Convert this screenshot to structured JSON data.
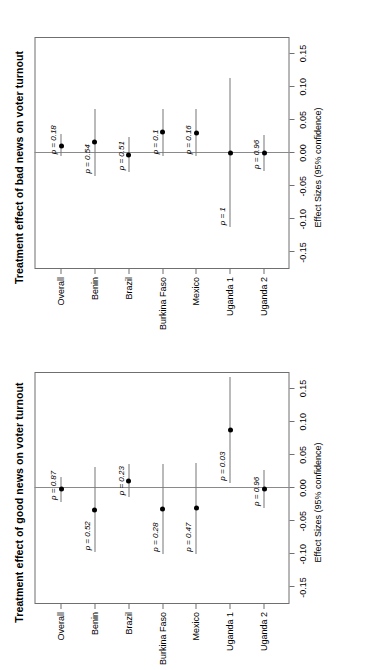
{
  "figure": {
    "orientation": "rotated-90-ccw",
    "axis_title": "Effect Sizes (95% confidence)",
    "xticks": [
      "-0.15",
      "-0.10",
      "-0.05",
      "0.00",
      "0.05",
      "0.10",
      "0.15"
    ],
    "categories": [
      "Overall",
      "Benin",
      "Brazil",
      "Burkina Faso",
      "Mexico",
      "Uganda 1",
      "Uganda 2"
    ]
  },
  "chart_data": [
    {
      "type": "scatter",
      "id": "good-news",
      "title": "Treatment effect of good news on voter turnout",
      "xlabel": "Effect Sizes (95% confidence)",
      "ylabel": "",
      "xlim": [
        -0.175,
        0.175
      ],
      "grid": false,
      "legend": "none",
      "categories": [
        "Overall",
        "Benin",
        "Brazil",
        "Burkina Faso",
        "Mexico",
        "Uganda 1",
        "Uganda 2"
      ],
      "values": [
        -0.002,
        -0.033,
        0.011,
        -0.031,
        -0.03,
        0.088,
        -0.002
      ],
      "ci_low": [
        -0.021,
        -0.097,
        -0.014,
        -0.099,
        -0.099,
        0.008,
        -0.03
      ],
      "ci_high": [
        0.017,
        0.031,
        0.036,
        0.036,
        0.038,
        0.168,
        0.027
      ],
      "annotations": [
        "p = 0.87",
        "p = 0.52",
        "p = 0.23",
        "p = 0.28",
        "p = 0.47",
        "p = 0.03",
        "p = 0.96"
      ],
      "pvalues": [
        0.87,
        0.52,
        0.23,
        0.28,
        0.47,
        0.03,
        0.96
      ]
    },
    {
      "type": "scatter",
      "id": "bad-news",
      "title": "Treatment effect of bad news on voter turnout",
      "xlabel": "Effect Sizes (95% confidence)",
      "ylabel": "",
      "xlim": [
        -0.175,
        0.175
      ],
      "grid": false,
      "legend": "none",
      "categories": [
        "Overall",
        "Benin",
        "Brazil",
        "Burkina Faso",
        "Mexico",
        "Uganda 1",
        "Uganda 2"
      ],
      "values": [
        0.011,
        0.016,
        -0.003,
        0.031,
        0.03,
        0.0,
        0.0
      ],
      "ci_low": [
        -0.005,
        -0.034,
        -0.029,
        -0.005,
        -0.005,
        -0.112,
        -0.027
      ],
      "ci_high": [
        0.028,
        0.066,
        0.024,
        0.067,
        0.066,
        0.113,
        0.027
      ],
      "annotations": [
        "p = 0.18",
        "p = 0.54",
        "p = 0.51",
        "p = 0.1",
        "p = 0.16",
        "p = 1",
        "p = 0.96"
      ],
      "pvalues": [
        0.18,
        0.54,
        0.51,
        0.1,
        0.16,
        1,
        0.96
      ]
    }
  ]
}
